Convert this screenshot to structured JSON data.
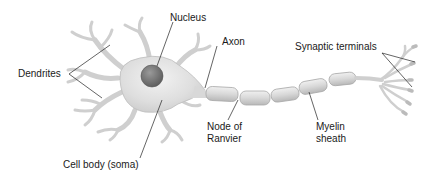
{
  "diagram": {
    "labels": {
      "nucleus": "Nucleus",
      "dendrites": "Dendrites",
      "axon": "Axon",
      "synaptic_terminals": "Synaptic terminals",
      "node_of_ranvier_line1": "Node of",
      "node_of_ranvier_line2": "Ranvier",
      "myelin_sheath_line1": "Myelin",
      "myelin_sheath_line2": "sheath",
      "cell_body": "Cell body (soma)"
    },
    "colors": {
      "cell_fill": "#dcdcdc",
      "cell_stroke": "#b5b5b5",
      "nucleus_fill": "#7a7a7a",
      "myelin_fill": "#d6d6d6",
      "leader_line": "#222222"
    }
  }
}
